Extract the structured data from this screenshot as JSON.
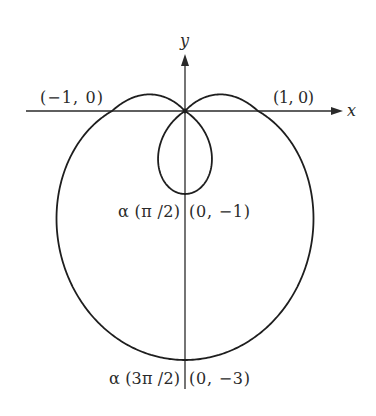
{
  "figure": {
    "type": "polar-curve",
    "curve": {
      "equation": "r = 1 - 2 sin θ",
      "a": 1,
      "b": -2,
      "function": "sin",
      "theta_range": [
        0,
        6.283185307
      ]
    },
    "axes": {
      "x_label": "x",
      "y_label": "y"
    },
    "points": [
      {
        "id": "p-neg1-0",
        "label": "(−1, 0)",
        "x": -1,
        "y": 0
      },
      {
        "id": "p-1-0",
        "label": "(1, 0)",
        "x": 1,
        "y": 0
      },
      {
        "id": "p-0-neg1",
        "label": "(0, −1)",
        "param_label": "α (π /2)",
        "x": 0,
        "y": -1
      },
      {
        "id": "p-0-neg3",
        "label": "(0, −3)",
        "param_label": "α (3π /2)",
        "x": 0,
        "y": -3
      }
    ],
    "colors": {
      "stroke": "#1e1e1e",
      "text": "#2a2a2a",
      "background": "#ffffff"
    }
  }
}
